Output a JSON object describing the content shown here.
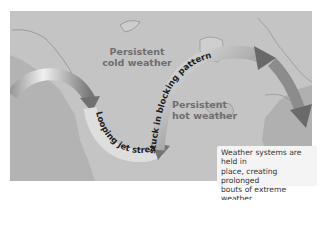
{
  "diagram": {
    "labels": {
      "cold": [
        "Persistent",
        "cold weather"
      ],
      "hot": [
        "Persistent",
        "hot weather"
      ]
    },
    "jet_stream": {
      "lower_text": "Looping jet stream stuck in blocking pattern",
      "part1": "Looping jet stream",
      "part2": "stuck in blocking pattern"
    },
    "callout": {
      "lines": [
        "Weather systems are held in",
        "place, creating prolonged",
        "bouts of extreme weather"
      ]
    },
    "colors": {
      "background": "#ffffff",
      "land": "#c4c4c4",
      "ocean": "#a9a9a9",
      "arrow_light": "#eeeeee",
      "arrow_dark": "#6a6a6a",
      "label_text": "#6e6e6e"
    }
  }
}
